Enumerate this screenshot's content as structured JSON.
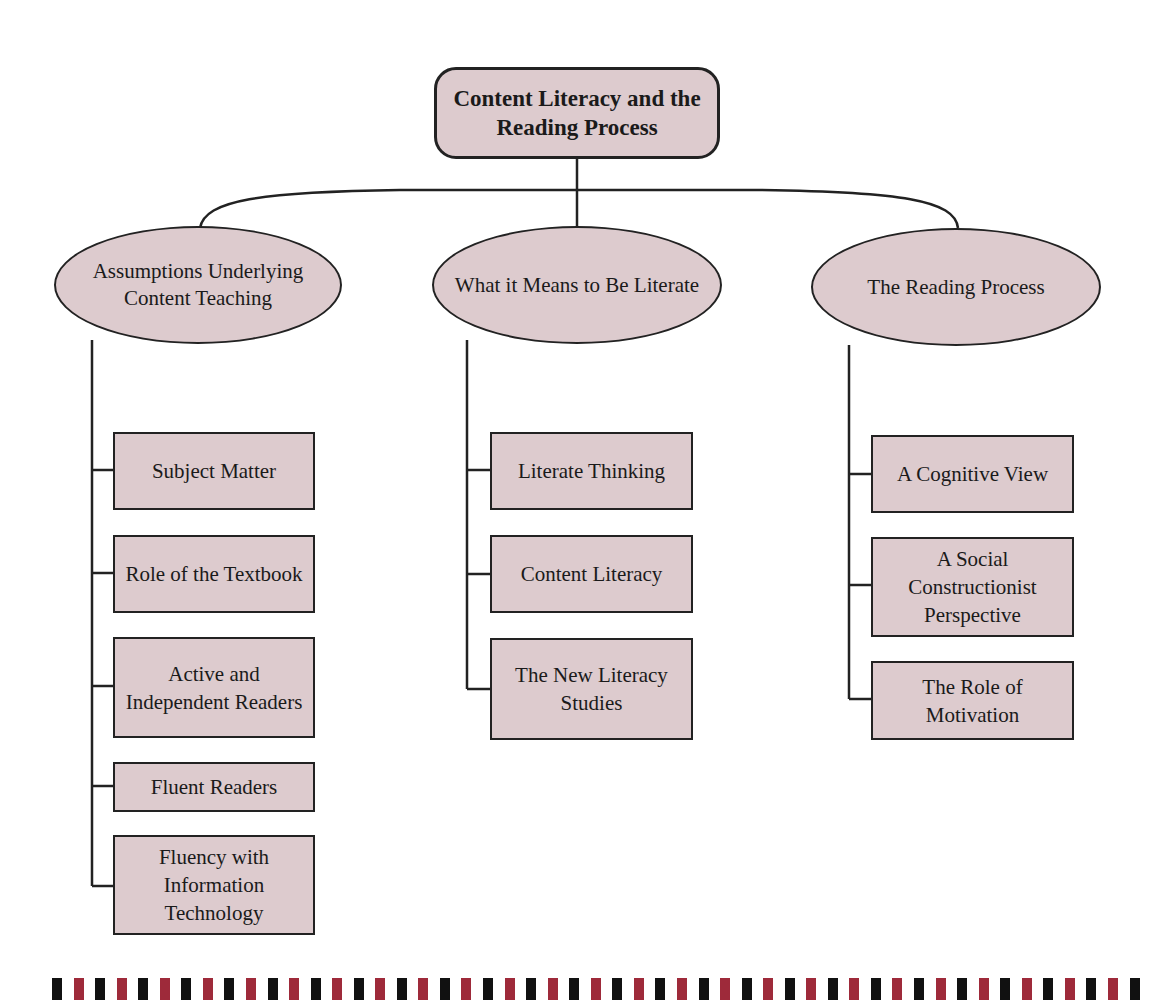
{
  "colors": {
    "node_fill": "#ddcbce",
    "line": "#222222",
    "stripe_black": "#111111",
    "stripe_red": "#9e2a3a"
  },
  "root": {
    "label": "Content Literacy and the Reading Process"
  },
  "branches": [
    {
      "label": "Assumptions Underlying Content Teaching",
      "children": [
        "Subject Matter",
        "Role of the Textbook",
        "Active and Independent Readers",
        "Fluent Readers",
        "Fluency with Information Technology"
      ]
    },
    {
      "label": "What it Means to Be Literate",
      "children": [
        "Literate Thinking",
        "Content Literacy",
        "The New Literacy Studies"
      ]
    },
    {
      "label": "The Reading Process",
      "children": [
        "A Cognitive View",
        "A Social Constructionist Perspective",
        "The Role of Motivation"
      ]
    }
  ],
  "footer": {
    "stripe_count": 51,
    "pattern": [
      "black",
      "red"
    ]
  }
}
